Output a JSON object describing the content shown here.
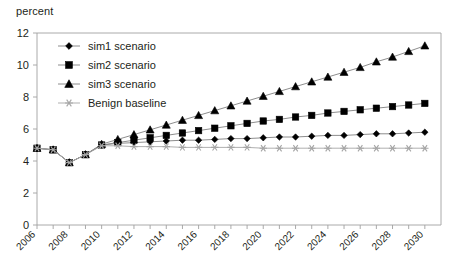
{
  "axis_title": "percent",
  "chart_data": {
    "type": "line",
    "title": "",
    "subtitle": "",
    "xlabel": "",
    "ylabel": "percent",
    "ylim": [
      0,
      12
    ],
    "xlim": [
      2006,
      2031
    ],
    "yticks": [
      0,
      2,
      4,
      6,
      8,
      10,
      12
    ],
    "xticks": [
      2006,
      2008,
      2010,
      2012,
      2014,
      2016,
      2018,
      2020,
      2022,
      2024,
      2026,
      2028,
      2030
    ],
    "xtick_rotation": 45,
    "grid": false,
    "legend_position": "upper-left",
    "x": [
      2006,
      2007,
      2008,
      2009,
      2010,
      2011,
      2012,
      2013,
      2014,
      2015,
      2016,
      2017,
      2018,
      2019,
      2020,
      2021,
      2022,
      2023,
      2024,
      2025,
      2026,
      2027,
      2028,
      2029,
      2030
    ],
    "series": [
      {
        "name": "sim1 scenario",
        "marker": "diamond",
        "color": "#000000",
        "values": [
          4.8,
          4.7,
          3.9,
          4.4,
          5.0,
          5.1,
          5.15,
          5.2,
          5.25,
          5.3,
          5.3,
          5.35,
          5.4,
          5.4,
          5.45,
          5.5,
          5.5,
          5.55,
          5.6,
          5.6,
          5.65,
          5.7,
          5.7,
          5.75,
          5.8
        ]
      },
      {
        "name": "sim2 scenario",
        "marker": "square",
        "color": "#000000",
        "values": [
          4.8,
          4.7,
          3.9,
          4.4,
          5.0,
          5.15,
          5.3,
          5.45,
          5.6,
          5.75,
          5.9,
          6.05,
          6.2,
          6.35,
          6.5,
          6.6,
          6.75,
          6.85,
          7.0,
          7.1,
          7.2,
          7.3,
          7.4,
          7.5,
          7.6
        ]
      },
      {
        "name": "sim3 scenario",
        "marker": "triangle",
        "color": "#000000",
        "values": [
          4.8,
          4.7,
          3.9,
          4.4,
          5.05,
          5.35,
          5.65,
          5.95,
          6.25,
          6.55,
          6.85,
          7.15,
          7.45,
          7.75,
          8.05,
          8.35,
          8.65,
          8.95,
          9.25,
          9.55,
          9.85,
          10.2,
          10.5,
          10.85,
          11.2
        ]
      },
      {
        "name": "Benign baseline",
        "marker": "asterisk",
        "color": "#a6a6a6",
        "values": [
          4.8,
          4.7,
          3.9,
          4.4,
          4.95,
          4.95,
          4.9,
          4.9,
          4.9,
          4.85,
          4.85,
          4.85,
          4.85,
          4.85,
          4.8,
          4.8,
          4.8,
          4.8,
          4.8,
          4.8,
          4.8,
          4.8,
          4.8,
          4.8,
          4.8
        ]
      }
    ]
  },
  "legend": {
    "items": [
      {
        "label": "sim1 scenario",
        "marker": "diamond",
        "color": "#000000"
      },
      {
        "label": "sim2 scenario",
        "marker": "square",
        "color": "#000000"
      },
      {
        "label": "sim3 scenario",
        "marker": "triangle",
        "color": "#000000"
      },
      {
        "label": "Benign baseline",
        "marker": "asterisk",
        "color": "#a6a6a6"
      }
    ]
  },
  "colors": {
    "axis": "#a0a0a0",
    "text": "#231f20",
    "series_dark": "#000000",
    "baseline_gray": "#a6a6a6",
    "line_gray": "#808080",
    "background": "#ffffff"
  }
}
